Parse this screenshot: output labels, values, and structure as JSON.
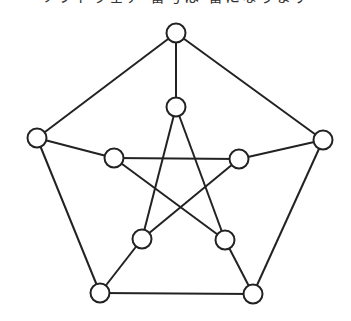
{
  "header": {
    "clipped_text": "ソフトウェア 番号は 番になります"
  },
  "diagram": {
    "type": "graph",
    "name": "Petersen graph",
    "stroke_color": "#222222",
    "node_fill": "#ffffff",
    "node_radius": 9.5,
    "nodes": [
      {
        "id": "outer-top",
        "x": 176,
        "y": 33
      },
      {
        "id": "outer-right",
        "x": 323,
        "y": 140
      },
      {
        "id": "outer-bottom-right",
        "x": 253,
        "y": 294
      },
      {
        "id": "outer-bottom-left",
        "x": 100,
        "y": 293
      },
      {
        "id": "outer-left",
        "x": 37,
        "y": 138
      },
      {
        "id": "inner-top",
        "x": 176,
        "y": 107
      },
      {
        "id": "inner-right",
        "x": 239,
        "y": 159
      },
      {
        "id": "inner-bottom-right",
        "x": 225,
        "y": 240
      },
      {
        "id": "inner-bottom-left",
        "x": 142,
        "y": 239
      },
      {
        "id": "inner-left",
        "x": 114,
        "y": 158
      }
    ],
    "edges": [
      [
        "outer-top",
        "outer-right"
      ],
      [
        "outer-right",
        "outer-bottom-right"
      ],
      [
        "outer-bottom-right",
        "outer-bottom-left"
      ],
      [
        "outer-bottom-left",
        "outer-left"
      ],
      [
        "outer-left",
        "outer-top"
      ],
      [
        "outer-top",
        "inner-top"
      ],
      [
        "outer-right",
        "inner-right"
      ],
      [
        "outer-bottom-right",
        "inner-bottom-right"
      ],
      [
        "outer-bottom-left",
        "inner-bottom-left"
      ],
      [
        "outer-left",
        "inner-left"
      ],
      [
        "inner-top",
        "inner-bottom-right"
      ],
      [
        "inner-top",
        "inner-bottom-left"
      ],
      [
        "inner-left",
        "inner-right"
      ],
      [
        "inner-left",
        "inner-bottom-right"
      ],
      [
        "inner-right",
        "inner-bottom-left"
      ]
    ]
  }
}
